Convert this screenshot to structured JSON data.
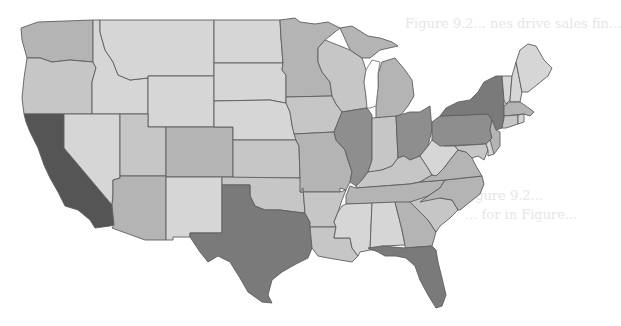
{
  "map": {
    "type": "choropleth",
    "region": "Contiguous United States",
    "legend_visible": false,
    "shade_levels": {
      "1": "#d6d6d6",
      "2": "#c6c6c6",
      "3": "#b4b4b4",
      "4": "#8e8e8e",
      "5": "#7a7a7a",
      "6": "#555555"
    },
    "states": [
      {
        "id": "WA",
        "shade": 3
      },
      {
        "id": "OR",
        "shade": 2
      },
      {
        "id": "CA",
        "shade": 6
      },
      {
        "id": "ID",
        "shade": 1
      },
      {
        "id": "NV",
        "shade": 1
      },
      {
        "id": "MT",
        "shade": 1
      },
      {
        "id": "WY",
        "shade": 1
      },
      {
        "id": "UT",
        "shade": 2
      },
      {
        "id": "CO",
        "shade": 3
      },
      {
        "id": "AZ",
        "shade": 3
      },
      {
        "id": "NM",
        "shade": 1
      },
      {
        "id": "ND",
        "shade": 1
      },
      {
        "id": "SD",
        "shade": 1
      },
      {
        "id": "NE",
        "shade": 1
      },
      {
        "id": "KS",
        "shade": 2
      },
      {
        "id": "OK",
        "shade": 2
      },
      {
        "id": "TX",
        "shade": 5
      },
      {
        "id": "MN",
        "shade": 3
      },
      {
        "id": "IA",
        "shade": 2
      },
      {
        "id": "MO",
        "shade": 3
      },
      {
        "id": "AR",
        "shade": 2
      },
      {
        "id": "LA",
        "shade": 2
      },
      {
        "id": "WI",
        "shade": 2
      },
      {
        "id": "IL",
        "shade": 4
      },
      {
        "id": "MI",
        "shade": 3
      },
      {
        "id": "IN",
        "shade": 2
      },
      {
        "id": "OH",
        "shade": 4
      },
      {
        "id": "KY",
        "shade": 2
      },
      {
        "id": "TN",
        "shade": 3
      },
      {
        "id": "MS",
        "shade": 1
      },
      {
        "id": "AL",
        "shade": 1
      },
      {
        "id": "GA",
        "shade": 3
      },
      {
        "id": "FL",
        "shade": 5
      },
      {
        "id": "SC",
        "shade": 2
      },
      {
        "id": "NC",
        "shade": 3
      },
      {
        "id": "WV",
        "shade": 1
      },
      {
        "id": "VA",
        "shade": 3
      },
      {
        "id": "PA",
        "shade": 4
      },
      {
        "id": "NY",
        "shade": 5
      },
      {
        "id": "NJ",
        "shade": 3
      },
      {
        "id": "MD",
        "shade": 2
      },
      {
        "id": "DE",
        "shade": 1
      },
      {
        "id": "VT",
        "shade": 1
      },
      {
        "id": "NH",
        "shade": 1
      },
      {
        "id": "ME",
        "shade": 1
      },
      {
        "id": "MA",
        "shade": 3
      },
      {
        "id": "CT",
        "shade": 2
      },
      {
        "id": "RI",
        "shade": 1
      }
    ]
  },
  "bleed_through_text": [
    "Figure 9.2... nes drive sales fin...",
    "Figure 9.2...",
    "... for in Figure..."
  ]
}
